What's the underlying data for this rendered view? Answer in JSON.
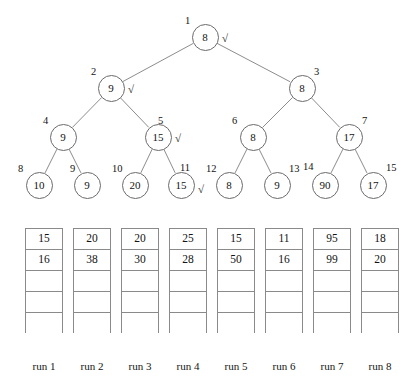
{
  "figure": {
    "stroke_color": "#6b6b6b",
    "text_color": "#131313",
    "background": "#ffffff",
    "check_glyph": "√"
  },
  "tree": {
    "nodes": [
      {
        "id": "1",
        "value": "8",
        "check": true,
        "cx": 205,
        "cy": 37,
        "r": 13.5,
        "index_x": 185,
        "index_y": 16,
        "check_x": 222,
        "check_y": 33
      },
      {
        "id": "2",
        "value": "9",
        "check": true,
        "cx": 111,
        "cy": 88,
        "r": 13.5,
        "index_x": 91,
        "index_y": 67,
        "check_x": 128,
        "check_y": 84
      },
      {
        "id": "3",
        "value": "8",
        "check": false,
        "cx": 302,
        "cy": 88,
        "r": 13.5,
        "index_x": 314,
        "index_y": 67,
        "check_x": 0,
        "check_y": 0
      },
      {
        "id": "4",
        "value": "9",
        "check": false,
        "cx": 63,
        "cy": 137,
        "r": 13.5,
        "index_x": 43,
        "index_y": 116,
        "check_x": 0,
        "check_y": 0
      },
      {
        "id": "5",
        "value": "15",
        "check": true,
        "cx": 158,
        "cy": 137,
        "r": 13.5,
        "index_x": 158,
        "index_y": 116,
        "check_x": 175,
        "check_y": 133
      },
      {
        "id": "6",
        "value": "8",
        "check": false,
        "cx": 253,
        "cy": 137,
        "r": 13.5,
        "index_x": 232,
        "index_y": 116,
        "check_x": 0,
        "check_y": 0
      },
      {
        "id": "7",
        "value": "17",
        "check": false,
        "cx": 349,
        "cy": 137,
        "r": 13.5,
        "index_x": 362,
        "index_y": 116,
        "check_x": 0,
        "check_y": 0
      },
      {
        "id": "8",
        "value": "10",
        "check": false,
        "cx": 39,
        "cy": 185,
        "r": 13.5,
        "index_x": 18,
        "index_y": 164,
        "check_x": 0,
        "check_y": 0
      },
      {
        "id": "9",
        "value": "9",
        "check": false,
        "cx": 87,
        "cy": 185,
        "r": 13.5,
        "index_x": 70,
        "index_y": 164,
        "check_x": 0,
        "check_y": 0
      },
      {
        "id": "10",
        "value": "20",
        "check": false,
        "cx": 135,
        "cy": 185,
        "r": 13.5,
        "index_x": 112,
        "index_y": 164,
        "check_x": 0,
        "check_y": 0
      },
      {
        "id": "11",
        "value": "15",
        "check": true,
        "cx": 181,
        "cy": 185,
        "r": 13.5,
        "index_x": 180,
        "index_y": 163,
        "check_x": 198,
        "check_y": 184
      },
      {
        "id": "12",
        "value": "8",
        "check": false,
        "cx": 229,
        "cy": 185,
        "r": 13.5,
        "index_x": 206,
        "index_y": 164,
        "check_x": 0,
        "check_y": 0
      },
      {
        "id": "13",
        "value": "9",
        "check": false,
        "cx": 277,
        "cy": 185,
        "r": 13.5,
        "index_x": 289,
        "index_y": 164,
        "check_x": 0,
        "check_y": 0
      },
      {
        "id": "14",
        "value": "90",
        "check": false,
        "cx": 325,
        "cy": 185,
        "r": 13.5,
        "index_x": 303,
        "index_y": 162,
        "check_x": 0,
        "check_y": 0
      },
      {
        "id": "15",
        "value": "17",
        "check": false,
        "cx": 373,
        "cy": 185,
        "r": 13.5,
        "index_x": 386,
        "index_y": 163,
        "check_x": 0,
        "check_y": 0
      }
    ],
    "edges": [
      {
        "from": "1",
        "to": "2"
      },
      {
        "from": "1",
        "to": "3"
      },
      {
        "from": "2",
        "to": "4"
      },
      {
        "from": "2",
        "to": "5"
      },
      {
        "from": "3",
        "to": "6"
      },
      {
        "from": "3",
        "to": "7"
      },
      {
        "from": "4",
        "to": "8"
      },
      {
        "from": "4",
        "to": "9"
      },
      {
        "from": "5",
        "to": "10"
      },
      {
        "from": "5",
        "to": "11"
      },
      {
        "from": "6",
        "to": "12"
      },
      {
        "from": "6",
        "to": "13"
      },
      {
        "from": "7",
        "to": "14"
      },
      {
        "from": "7",
        "to": "15"
      }
    ]
  },
  "runs": {
    "rows_per_run": 5,
    "columns": [
      {
        "label": "run 1",
        "x": 25,
        "values": [
          "15",
          "16",
          "",
          "",
          ""
        ]
      },
      {
        "label": "run 2",
        "x": 73,
        "values": [
          "20",
          "38",
          "",
          "",
          ""
        ]
      },
      {
        "label": "run 3",
        "x": 121,
        "values": [
          "20",
          "30",
          "",
          "",
          ""
        ]
      },
      {
        "label": "run 4",
        "x": 169,
        "values": [
          "25",
          "28",
          "",
          "",
          ""
        ]
      },
      {
        "label": "run 5",
        "x": 217,
        "values": [
          "15",
          "50",
          "",
          "",
          ""
        ]
      },
      {
        "label": "run 6",
        "x": 265,
        "values": [
          "11",
          "16",
          "",
          "",
          ""
        ]
      },
      {
        "label": "run 7",
        "x": 313,
        "values": [
          "95",
          "99",
          "",
          "",
          ""
        ]
      },
      {
        "label": "run 8",
        "x": 361,
        "values": [
          "18",
          "20",
          "",
          "",
          ""
        ]
      }
    ],
    "table_top": 228,
    "label_y": 361
  }
}
